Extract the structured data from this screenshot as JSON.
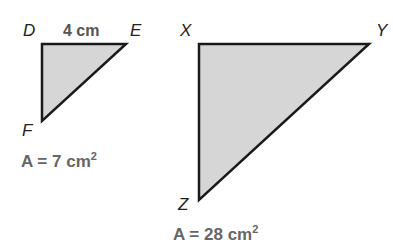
{
  "small_triangle": {
    "vertices": {
      "top_left": "D",
      "top_right": "E",
      "bottom": "F"
    },
    "side_label": "4 cm",
    "area_prefix": "A = 7 cm",
    "area_exp": "2",
    "fill": "#d6d6d6"
  },
  "large_triangle": {
    "vertices": {
      "top_left": "X",
      "top_right": "Y",
      "bottom": "Z"
    },
    "area_prefix": "A = 28 cm",
    "area_exp": "2",
    "fill": "#d6d6d6"
  }
}
